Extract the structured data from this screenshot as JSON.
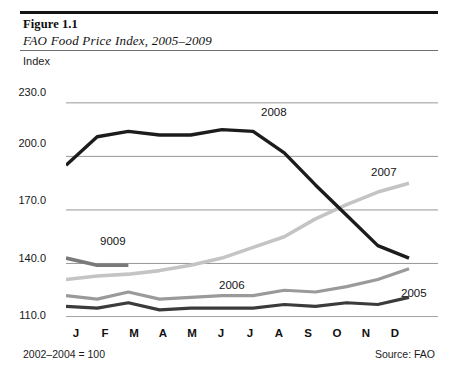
{
  "header": {
    "figure_number": "Figure 1.1",
    "subtitle": "FAO Food Price Index, 2005–2009",
    "axis_unit": "Index"
  },
  "footer": {
    "base_note": "2002–2004 = 100",
    "source": "Source: FAO"
  },
  "series_labels": {
    "y2008": "2008",
    "y2007": "2007",
    "y2009": "9009",
    "y2006": "2006",
    "y2005": "2005"
  },
  "chart_data": {
    "type": "line",
    "title": "FAO Food Price Index, 2005–2009",
    "subtitle": "Index",
    "xlabel": "",
    "ylabel": "Index",
    "note": "2002–2004 = 100",
    "source": "Source: FAO",
    "grid": true,
    "legend": "inline-annotations",
    "categories": [
      "J",
      "F",
      "M",
      "A",
      "M",
      "J",
      "J",
      "A",
      "S",
      "O",
      "N",
      "D"
    ],
    "ylim": [
      110.0,
      240.0
    ],
    "yticks": [
      110.0,
      140.0,
      170.0,
      200.0,
      230.0
    ],
    "ytick_labels": [
      "110.0",
      "140.0",
      "170.0",
      "200.0",
      "230.0"
    ],
    "series": [
      {
        "name": "2008",
        "color": "#1c1c1c",
        "width": 3.4,
        "values": [
          195.0,
          211.0,
          214.0,
          212.0,
          212.0,
          215.0,
          214.0,
          202.0,
          184.0,
          167.0,
          150.0,
          143.0
        ]
      },
      {
        "name": "2007",
        "color": "#c4c4c4",
        "width": 3.6,
        "values": [
          131.0,
          133.0,
          134.0,
          136.0,
          139.0,
          143.0,
          149.0,
          155.0,
          165.0,
          173.0,
          180.0,
          185.0
        ]
      },
      {
        "name": "9009",
        "color": "#7a7a7a",
        "width": 3.6,
        "values": [
          143.0,
          139.0,
          139.0,
          null,
          null,
          null,
          null,
          null,
          null,
          null,
          null,
          null
        ]
      },
      {
        "name": "2006",
        "color": "#9a9a9a",
        "width": 3.2,
        "values": [
          122.0,
          120.0,
          124.0,
          120.0,
          121.0,
          122.0,
          122.0,
          125.0,
          124.0,
          127.0,
          131.0,
          137.0
        ]
      },
      {
        "name": "2005",
        "color": "#3b3b3b",
        "width": 3.2,
        "values": [
          116.0,
          115.0,
          118.0,
          114.0,
          115.0,
          115.0,
          115.0,
          117.0,
          116.0,
          118.0,
          117.0,
          121.0
        ]
      }
    ]
  }
}
